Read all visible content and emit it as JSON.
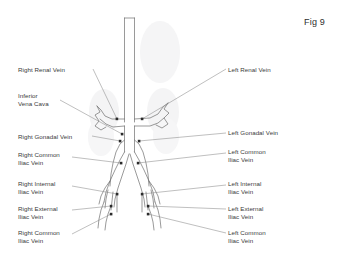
{
  "figure": {
    "caption": "Fig 9"
  },
  "colors": {
    "vessel_stroke": "#6b6b6b",
    "leader_line": "#7a7a7a",
    "marker": "#2b2b2b",
    "kidney_fill": "#ececed",
    "text": "#3a3a3a",
    "background": "#ffffff"
  },
  "labels": {
    "left": [
      {
        "id": "right-renal-vein",
        "text": "Right Renal Vein",
        "lines": [
          "Right Renal Vein"
        ],
        "x": 18,
        "y": 66
      },
      {
        "id": "inferior-vena-cava",
        "text": "Inferior Vena Cava",
        "lines": [
          "Inferior",
          "Vena Cava"
        ],
        "x": 18,
        "y": 92
      },
      {
        "id": "right-gonadal-vein",
        "text": "Right Gonadal Vein",
        "lines": [
          "Right Gonadal Vein"
        ],
        "x": 18,
        "y": 134
      },
      {
        "id": "right-common-iliac-vein-upper",
        "text": "Right Common Iliac Vein",
        "lines": [
          "Right Common",
          "Iliac Vein"
        ],
        "x": 18,
        "y": 152
      },
      {
        "id": "right-internal-iliac-vein",
        "text": "Right Internal Iliac Vein",
        "lines": [
          "Right Internal",
          "Iliac Vein"
        ],
        "x": 18,
        "y": 181
      },
      {
        "id": "right-external-iliac-vein",
        "text": "Right External Iliac Vein",
        "lines": [
          "Right External",
          "Iliac Vein"
        ],
        "x": 18,
        "y": 206
      },
      {
        "id": "right-common-iliac-vein-lower",
        "text": "Right Common Iliac Vein",
        "lines": [
          "Right Common",
          "Iliac Vein"
        ],
        "x": 18,
        "y": 230
      }
    ],
    "right": [
      {
        "id": "left-renal-vein",
        "text": "Left Renal Vein",
        "lines": [
          "Left Renal Vein"
        ],
        "x": 228,
        "y": 66
      },
      {
        "id": "left-gonadal-vein",
        "text": "Left Gonadal Vein",
        "lines": [
          "Left Gonadal Vein"
        ],
        "x": 228,
        "y": 130
      },
      {
        "id": "left-common-iliac-vein-upper",
        "text": "Left Common Iliac Vein",
        "lines": [
          "Left Common",
          "Iliac Vein"
        ],
        "x": 228,
        "y": 148
      },
      {
        "id": "left-internal-iliac-vein",
        "text": "Left Internal Iliac Vein",
        "lines": [
          "Left Internal",
          "Iliac Vein"
        ],
        "x": 228,
        "y": 181
      },
      {
        "id": "left-external-iliac-vein",
        "text": "Left External Iliac Vein",
        "lines": [
          "Left External",
          "Iliac Vein"
        ],
        "x": 228,
        "y": 206
      },
      {
        "id": "left-common-iliac-vein-lower",
        "text": "Left Common Iliac Vein",
        "lines": [
          "Left Common",
          "Iliac Vein"
        ],
        "x": 228,
        "y": 230
      }
    ]
  }
}
